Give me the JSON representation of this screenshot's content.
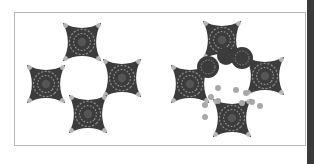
{
  "figure": {
    "panels": [
      {
        "name": "block-left",
        "patches": 4,
        "petals": 4
      },
      {
        "name": "block-right",
        "patches": 4,
        "circles": 3,
        "petals_with_dots": 2
      }
    ],
    "colors": {
      "patch": "#3c3c3c",
      "dot": "#b5b5b5",
      "stitch": "#8a8a8a",
      "background": "#ffffff",
      "frame": "#b8b8b8",
      "strip": "#3a3a3a"
    }
  }
}
